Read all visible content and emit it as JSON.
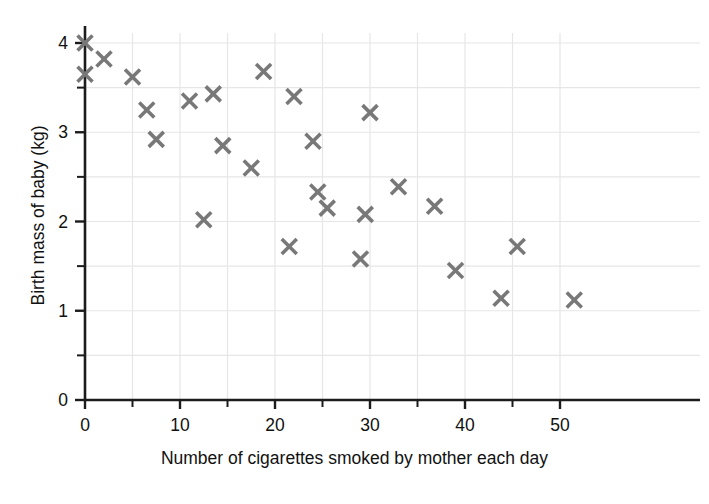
{
  "figure": {
    "artifact_text": "",
    "marker_color": "#787878",
    "axis_color": "#1c1c1c",
    "grid_color": "#e6e6e6"
  },
  "chart_data": {
    "type": "scatter",
    "title": "",
    "xlabel": "Number of cigarettes smoked by mother each day",
    "ylabel": "Birth mass of baby (kg)",
    "xlim": [
      0,
      54
    ],
    "ylim": [
      0,
      4.2
    ],
    "xticks": [
      0,
      10,
      20,
      30,
      40,
      50
    ],
    "xtick_labels": [
      "0",
      "10",
      "20",
      "30",
      "40",
      "50"
    ],
    "xminor_step": 5,
    "yticks": [
      0,
      1,
      2,
      3,
      4
    ],
    "ytick_labels": [
      "0",
      "1",
      "2",
      "3",
      "4"
    ],
    "yminor_step": 0.5,
    "grid": true,
    "legend": null,
    "marker": "x",
    "points": [
      {
        "x": 0,
        "y": 4.0
      },
      {
        "x": 0,
        "y": 3.65
      },
      {
        "x": 2,
        "y": 3.82
      },
      {
        "x": 5,
        "y": 3.62
      },
      {
        "x": 6.5,
        "y": 3.25
      },
      {
        "x": 7.5,
        "y": 2.92
      },
      {
        "x": 11,
        "y": 3.35
      },
      {
        "x": 12.5,
        "y": 2.02
      },
      {
        "x": 13.5,
        "y": 3.43
      },
      {
        "x": 14.5,
        "y": 2.85
      },
      {
        "x": 17.5,
        "y": 2.6
      },
      {
        "x": 18.8,
        "y": 3.68
      },
      {
        "x": 21.5,
        "y": 1.72
      },
      {
        "x": 22,
        "y": 3.4
      },
      {
        "x": 24,
        "y": 2.9
      },
      {
        "x": 24.5,
        "y": 2.33
      },
      {
        "x": 25.5,
        "y": 2.15
      },
      {
        "x": 29,
        "y": 1.58
      },
      {
        "x": 29.5,
        "y": 2.08
      },
      {
        "x": 30,
        "y": 3.22
      },
      {
        "x": 33,
        "y": 2.39
      },
      {
        "x": 36.8,
        "y": 2.17
      },
      {
        "x": 39,
        "y": 1.45
      },
      {
        "x": 43.8,
        "y": 1.14
      },
      {
        "x": 45.5,
        "y": 1.72
      },
      {
        "x": 51.5,
        "y": 1.12
      }
    ]
  }
}
